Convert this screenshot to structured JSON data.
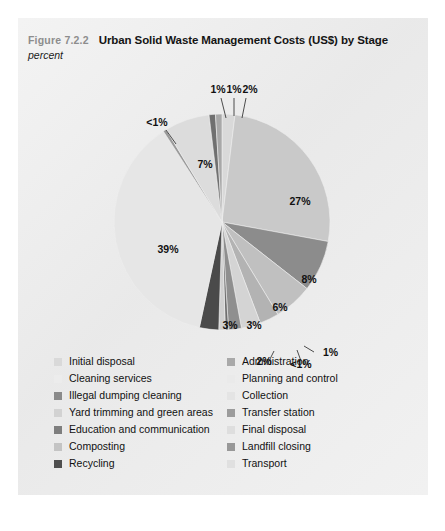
{
  "figure": {
    "number": "Figure 7.2.2",
    "title": "Urban Solid Waste Management Costs (US$) by Stage",
    "subtitle": "percent"
  },
  "panel": {
    "background": "#eeeeee"
  },
  "chart_data": {
    "type": "pie",
    "title": "Urban Solid Waste Management Costs (US$) by Stage",
    "subtitle": "percent",
    "unit": "percent",
    "legend_position": "bottom",
    "grid": false,
    "start_angle_deg": 0,
    "direction": "clockwise",
    "categories": [
      "Initial disposal",
      "Administration",
      "Planning and control",
      "Collection",
      "Transfer station",
      "Final disposal",
      "Landfill closing",
      "Transport",
      "Cleaning services",
      "Illegal dumping cleaning",
      "Yard trimming and green areas",
      "Education and communication",
      "Composting",
      "Recycling"
    ],
    "values": [
      2,
      27,
      8,
      6,
      3,
      3,
      2,
      0.5,
      1,
      3,
      39,
      0.5,
      7,
      1
    ],
    "labels": [
      "2%",
      "27%",
      "8%",
      "6%",
      "3%",
      "3%",
      "2%",
      "<1%",
      "1%",
      "3%",
      "39%",
      "<1%",
      "7%",
      "1%"
    ],
    "colors": [
      "#d9d9d9",
      "#c9c9c9",
      "#8c8c8c",
      "#c0c0c0",
      "#b3b3b3",
      "#d4d4d4",
      "#8f8f8f",
      "#6e6e6e",
      "#cfcfcf",
      "#4a4a4a",
      "#e6e6e6",
      "#9a9a9a",
      "#dcdcdc",
      "#707070"
    ]
  },
  "slices": [
    {
      "label": "2%",
      "value": 2,
      "color": "#d9d9d9",
      "lx": 232,
      "ly": 75,
      "leader": "M 228 80 L 224 100",
      "anchor": "middle"
    },
    {
      "label": "27%",
      "value": 27,
      "color": "#c9c9c9",
      "lx": 282,
      "ly": 187,
      "leader": "",
      "anchor": "middle"
    },
    {
      "label": "8%",
      "value": 8,
      "color": "#8c8c8c",
      "lx": 291,
      "ly": 265,
      "leader": "",
      "anchor": "middle"
    },
    {
      "label": "6%",
      "value": 6,
      "color": "#c0c0c0",
      "lx": 262,
      "ly": 293,
      "leader": "",
      "anchor": "middle"
    },
    {
      "label": "3%",
      "value": 3,
      "color": "#b3b3b3",
      "lx": 236,
      "ly": 311,
      "leader": "",
      "anchor": "middle"
    },
    {
      "label": "3%",
      "value": 3,
      "color": "#d4d4d4",
      "lx": 212,
      "ly": 311,
      "leader": "",
      "anchor": "middle"
    },
    {
      "label": "2%",
      "value": 2,
      "color": "#8f8f8f",
      "lx": 246,
      "ly": 347,
      "leader": "M 252 341 L 256 333",
      "anchor": "middle"
    },
    {
      "label": "<1%",
      "value": 0.5,
      "color": "#6e6e6e",
      "lx": 283,
      "ly": 350,
      "leader": "M 283 343 L 279 332",
      "anchor": "middle"
    },
    {
      "label": "1%",
      "value": 1,
      "color": "#cfcfcf",
      "lx": 305,
      "ly": 338,
      "leader": "M 296 334 L 286 328",
      "anchor": "start"
    },
    {
      "label": "3%",
      "value": 3,
      "color": "#4a4a4a",
      "lx": 0,
      "ly": 0,
      "leader": "",
      "anchor": "middle",
      "hide": true
    },
    {
      "label": "39%",
      "value": 39,
      "color": "#e6e6e6",
      "lx": 150,
      "ly": 235,
      "leader": "",
      "anchor": "middle"
    },
    {
      "label": "<1%",
      "value": 0.5,
      "color": "#9a9a9a",
      "lx": 139,
      "ly": 108,
      "leader": "M 148 112 L 158 126",
      "anchor": "middle"
    },
    {
      "label": "7%",
      "value": 7,
      "color": "#dcdcdc",
      "lx": 187,
      "ly": 150,
      "leader": "",
      "anchor": "middle"
    },
    {
      "label": "1%",
      "value": 1,
      "color": "#707070",
      "lx": 200,
      "ly": 75,
      "leader": "M 203 80 L 208 100",
      "anchor": "middle"
    },
    {
      "label": "1%",
      "value": 1,
      "color": "#a8a8a8",
      "lx": 216,
      "ly": 75,
      "leader": "M 216 80 L 216 98",
      "anchor": "middle"
    }
  ],
  "legend": {
    "left": [
      {
        "label": "Initial disposal",
        "color": "#d9d9d9"
      },
      {
        "label": "Cleaning services",
        "color": "#ececec"
      },
      {
        "label": "Illegal dumping cleaning",
        "color": "#8a8a8a"
      },
      {
        "label": "Yard trimming and green areas",
        "color": "#d2d2d2"
      },
      {
        "label": "Education and communication",
        "color": "#7e7e7e"
      },
      {
        "label": "Composting",
        "color": "#c4c4c4"
      },
      {
        "label": "Recycling",
        "color": "#4f4f4f"
      }
    ],
    "right": [
      {
        "label": "Administration",
        "color": "#a9a9a9"
      },
      {
        "label": "Planning and control",
        "color": "#eaeaea"
      },
      {
        "label": "Collection",
        "color": "#e4e4e4"
      },
      {
        "label": "Transfer station",
        "color": "#9c9c9c"
      },
      {
        "label": "Final disposal",
        "color": "#dedede"
      },
      {
        "label": "Landfill closing",
        "color": "#989898"
      },
      {
        "label": "Transport",
        "color": "#e0e0e0"
      }
    ]
  }
}
